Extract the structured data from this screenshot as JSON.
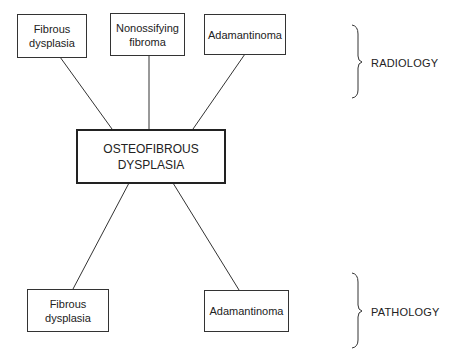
{
  "center": {
    "text_line1": "OSTEOFIBROUS",
    "text_line2": "DYSPLASIA"
  },
  "radiology": {
    "label": "RADIOLOGY",
    "boxes": [
      {
        "line1": "Fibrous",
        "line2": "dysplasia"
      },
      {
        "line1": "Nonossifying",
        "line2": "fibroma"
      },
      {
        "line1": "Adamantinoma",
        "line2": ""
      }
    ]
  },
  "pathology": {
    "label": "PATHOLOGY",
    "boxes": [
      {
        "line1": "Fibrous",
        "line2": "dysplasia"
      },
      {
        "line1": "Adamantinoma",
        "line2": ""
      }
    ]
  },
  "colors": {
    "line": "#333333",
    "background": "#ffffff"
  }
}
